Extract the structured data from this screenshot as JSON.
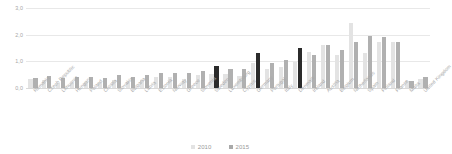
{
  "chart_data": {
    "type": "bar",
    "title": "",
    "xlabel": "",
    "ylabel": "",
    "ylim": [
      0.0,
      3.0
    ],
    "grid": true,
    "legend_position": "bottom-center",
    "y_ticks": [
      "0,0",
      "1,0",
      "2,0",
      "3,0"
    ],
    "y_tick_values": [
      0.0,
      1.0,
      2.0,
      3.0
    ],
    "categories": [
      "Romania",
      "Czech Republic",
      "Lithuania",
      "Hungary",
      "Poland",
      "Croatia",
      "Slovakia",
      "Bulgaria",
      "Latvia",
      "Estonia",
      "Norway",
      "Greece",
      "Slovenia",
      "Sweden",
      "Luxembourg",
      "Cyprus",
      "Germany",
      "Portugal",
      "Italy",
      "Denmark",
      "Ireland",
      "Austria",
      "Belgium",
      "Netherlands",
      "Spain",
      "Finland",
      "France",
      "Malta",
      "United Kingdom"
    ],
    "series": [
      {
        "name": "2010",
        "color": "#e3e3e3",
        "values": [
          0.32,
          0.3,
          0.2,
          0.18,
          0.22,
          0.17,
          0.3,
          0.23,
          0.3,
          0.4,
          0.42,
          0.33,
          0.5,
          0.52,
          0.52,
          0.45,
          0.92,
          0.72,
          0.8,
          0.98,
          1.35,
          1.62,
          1.22,
          2.45,
          1.3,
          1.72,
          1.72,
          0.25,
          0.32
        ]
      },
      {
        "name": "2015",
        "color": "#b0b0b0",
        "highlight_color": "#2b2b2b",
        "highlighted": [
          "Sweden",
          "Germany",
          "Denmark"
        ],
        "values": [
          0.36,
          0.46,
          0.38,
          0.42,
          0.4,
          0.36,
          0.48,
          0.42,
          0.48,
          0.56,
          0.55,
          0.58,
          0.62,
          0.82,
          0.7,
          0.7,
          1.3,
          0.95,
          1.05,
          1.5,
          1.25,
          1.6,
          1.42,
          1.72,
          1.95,
          1.9,
          1.72,
          0.26,
          0.4
        ]
      }
    ]
  },
  "legend": {
    "items": [
      {
        "label": "2010",
        "color": "#e3e3e3"
      },
      {
        "label": "2015",
        "color": "#a9a9a9"
      }
    ]
  }
}
